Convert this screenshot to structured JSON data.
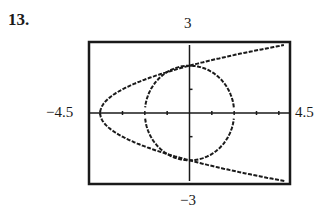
{
  "problem": {
    "number": "13."
  },
  "window": {
    "xmin_label": "−4.5",
    "xmax_label": "4.5",
    "ymax_label": "3",
    "ymin_label": "−3"
  },
  "colors": {
    "ink": "#1a1a1a",
    "background": "#ffffff"
  },
  "chart_data": {
    "type": "line",
    "title": "",
    "xlabel": "",
    "ylabel": "",
    "xlim": [
      -4.5,
      4.5
    ],
    "ylim": [
      -3,
      3
    ],
    "xticks_step": 1,
    "yticks_step": 1,
    "grid": false,
    "legend": null,
    "series": [
      {
        "name": "parabola x = y^2 - 4",
        "equation": "x = y^2 - 4",
        "vertex": [
          -4,
          0
        ],
        "y_intercepts": [
          2,
          -2
        ],
        "style": "dotted"
      },
      {
        "name": "circle x^2 + y^2 = 4",
        "equation": "x^2 + y^2 = 4",
        "center": [
          0,
          0
        ],
        "radius": 2,
        "style": "dotted"
      }
    ],
    "intersections": [
      [
        0,
        2
      ],
      [
        0,
        -2
      ]
    ]
  }
}
